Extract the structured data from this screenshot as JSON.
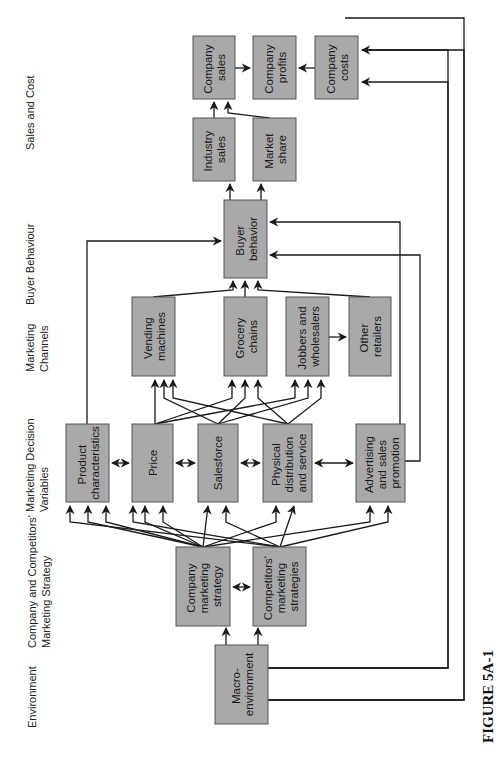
{
  "figure": {
    "label": "FIGURE 5A-1",
    "orientation": "rotated-90-ccw"
  },
  "columns": [
    {
      "id": "sales_cost",
      "lines": [
        "Sales and Cost"
      ]
    },
    {
      "id": "buyer_behaviour",
      "lines": [
        "Buyer Behaviour"
      ]
    },
    {
      "id": "marketing_channels",
      "lines": [
        "Marketing",
        "Channels"
      ]
    },
    {
      "id": "marketing_decision",
      "lines": [
        "Marketing Decision",
        "Variables"
      ]
    },
    {
      "id": "strategy",
      "lines": [
        "Company and Competitors'",
        "Marketing Strategy"
      ]
    },
    {
      "id": "environment",
      "lines": [
        "Environment"
      ]
    }
  ],
  "nodes": [
    {
      "id": "company_sales",
      "lines": [
        "Company",
        "sales"
      ]
    },
    {
      "id": "company_profits",
      "lines": [
        "Company",
        "profits"
      ]
    },
    {
      "id": "company_costs",
      "lines": [
        "Company",
        "costs"
      ]
    },
    {
      "id": "industry_sales",
      "lines": [
        "Industry",
        "sales"
      ]
    },
    {
      "id": "market_share",
      "lines": [
        "Market",
        "share"
      ]
    },
    {
      "id": "buyer_behavior",
      "lines": [
        "Buyer",
        "behavior"
      ]
    },
    {
      "id": "vending_machines",
      "lines": [
        "Vending",
        "machines"
      ]
    },
    {
      "id": "grocery_chains",
      "lines": [
        "Grocery",
        "chains"
      ]
    },
    {
      "id": "jobbers_wholesalers",
      "lines": [
        "Jobbers and",
        "wholesalers"
      ]
    },
    {
      "id": "other_retailers",
      "lines": [
        "Other",
        "retailers"
      ]
    },
    {
      "id": "product_characteristics",
      "lines": [
        "Product",
        "characteristics"
      ]
    },
    {
      "id": "price",
      "lines": [
        "Price"
      ]
    },
    {
      "id": "salesforce",
      "lines": [
        "Salesforce"
      ]
    },
    {
      "id": "physical_distribution",
      "lines": [
        "Physical",
        "distribution",
        "and service"
      ]
    },
    {
      "id": "advertising",
      "lines": [
        "Advertising",
        "and sales",
        "promotion"
      ]
    },
    {
      "id": "company_strategy",
      "lines": [
        "Company",
        "marketing",
        "strategy"
      ]
    },
    {
      "id": "competitor_strategies",
      "lines": [
        "Competitors'",
        "marketing",
        "strategies"
      ]
    },
    {
      "id": "macro_environment",
      "lines": [
        "Macro-",
        "environment"
      ]
    }
  ],
  "edges": [
    {
      "from": "macro_environment",
      "to": "company_strategy"
    },
    {
      "from": "macro_environment",
      "to": "competitor_strategies"
    },
    {
      "from": "macro_environment",
      "to": "company_sales"
    },
    {
      "from": "macro_environment",
      "to": "company_costs"
    },
    {
      "from": "company_strategy",
      "to": "competitor_strategies",
      "bidirectional": true
    },
    {
      "from": "company_strategy",
      "to": "product_characteristics"
    },
    {
      "from": "company_strategy",
      "to": "price"
    },
    {
      "from": "company_strategy",
      "to": "salesforce"
    },
    {
      "from": "company_strategy",
      "to": "physical_distribution"
    },
    {
      "from": "company_strategy",
      "to": "advertising"
    },
    {
      "from": "competitor_strategies",
      "to": "product_characteristics"
    },
    {
      "from": "competitor_strategies",
      "to": "price"
    },
    {
      "from": "competitor_strategies",
      "to": "salesforce"
    },
    {
      "from": "competitor_strategies",
      "to": "physical_distribution"
    },
    {
      "from": "competitor_strategies",
      "to": "advertising"
    },
    {
      "from": "product_characteristics",
      "to": "price",
      "bidirectional": true
    },
    {
      "from": "price",
      "to": "salesforce",
      "bidirectional": true
    },
    {
      "from": "salesforce",
      "to": "physical_distribution",
      "bidirectional": true
    },
    {
      "from": "physical_distribution",
      "to": "advertising",
      "bidirectional": true
    },
    {
      "from": "price",
      "to": "vending_machines"
    },
    {
      "from": "price",
      "to": "grocery_chains"
    },
    {
      "from": "price",
      "to": "jobbers_wholesalers"
    },
    {
      "from": "salesforce",
      "to": "vending_machines"
    },
    {
      "from": "salesforce",
      "to": "grocery_chains"
    },
    {
      "from": "salesforce",
      "to": "jobbers_wholesalers"
    },
    {
      "from": "physical_distribution",
      "to": "vending_machines"
    },
    {
      "from": "physical_distribution",
      "to": "grocery_chains"
    },
    {
      "from": "physical_distribution",
      "to": "jobbers_wholesalers"
    },
    {
      "from": "jobbers_wholesalers",
      "to": "other_retailers"
    },
    {
      "from": "vending_machines",
      "to": "buyer_behavior"
    },
    {
      "from": "grocery_chains",
      "to": "buyer_behavior"
    },
    {
      "from": "other_retailers",
      "to": "buyer_behavior"
    },
    {
      "from": "product_characteristics",
      "to": "buyer_behavior"
    },
    {
      "from": "advertising",
      "to": "buyer_behavior"
    },
    {
      "from": "buyer_behavior",
      "to": "industry_sales"
    },
    {
      "from": "buyer_behavior",
      "to": "market_share"
    },
    {
      "from": "industry_sales",
      "to": "company_sales"
    },
    {
      "from": "market_share",
      "to": "company_sales"
    },
    {
      "from": "company_sales",
      "to": "company_profits"
    },
    {
      "from": "company_costs",
      "to": "company_profits"
    }
  ]
}
